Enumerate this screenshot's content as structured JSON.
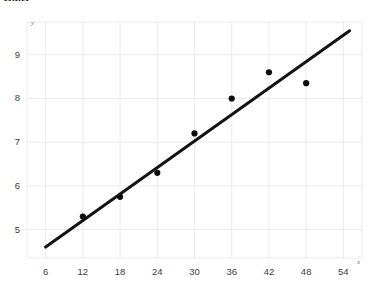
{
  "figure": {
    "clipped_top_text": "SMB",
    "background_color": "#ffffff",
    "marker_color": "#0d0d0d",
    "line_color": "#141414",
    "grid_color": "#ebebeb",
    "tick_text_color": "#3d3d3d",
    "axis_title_color": "#6e6e6e"
  },
  "chart_data": {
    "type": "scatter",
    "title": "",
    "subtitle": "",
    "xlabel": "x",
    "ylabel": "y",
    "xlim": [
      3,
      57
    ],
    "ylim": [
      4.35,
      9.75
    ],
    "xticks": [
      6,
      12,
      18,
      24,
      30,
      36,
      42,
      48,
      54
    ],
    "yticks": [
      5,
      6,
      7,
      8,
      9
    ],
    "xticklabels": [
      "6",
      "12",
      "18",
      "24",
      "30",
      "36",
      "42",
      "48",
      "54"
    ],
    "yticklabels": [
      "5",
      "6",
      "7",
      "8",
      "9"
    ],
    "grid": true,
    "grid_axis": "both",
    "legend": false,
    "legend_position": "none",
    "series": [
      {
        "name": "data points",
        "type": "scatter",
        "marker": "circle",
        "marker_size": 5,
        "color": "#0d0d0d",
        "x": [
          12,
          18,
          24,
          30,
          36,
          42,
          48
        ],
        "y": [
          5.3,
          5.75,
          6.3,
          7.2,
          8.0,
          8.6,
          8.35
        ],
        "points": [
          {
            "x": 12,
            "y": 5.3
          },
          {
            "x": 18,
            "y": 5.75
          },
          {
            "x": 24,
            "y": 6.3
          },
          {
            "x": 30,
            "y": 7.2
          },
          {
            "x": 36,
            "y": 8.0
          },
          {
            "x": 42,
            "y": 8.6
          },
          {
            "x": 48,
            "y": 8.35
          }
        ]
      },
      {
        "name": "trend line",
        "type": "line",
        "color": "#141414",
        "line_width": 3,
        "x": [
          6,
          55
        ],
        "y": [
          4.6,
          9.55
        ]
      }
    ]
  }
}
